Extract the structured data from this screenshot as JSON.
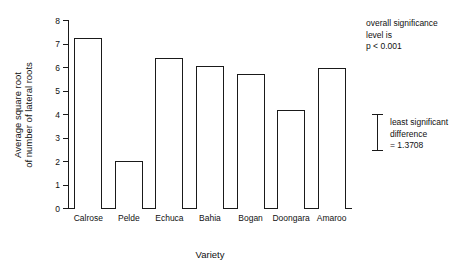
{
  "chart_data": {
    "type": "bar",
    "title": "",
    "subtitle": "",
    "xlabel": "Variety",
    "ylabel": "Average square root\nof number of lateral roots",
    "ylabel_line1": "Average square root",
    "ylabel_line2": "of number of lateral roots",
    "categories": [
      "Calrose",
      "Pelde",
      "Echuca",
      "Bahia",
      "Bogan",
      "Doongara",
      "Amaroo"
    ],
    "values": [
      7.25,
      2.0,
      6.4,
      6.05,
      5.7,
      4.15,
      5.95
    ],
    "ylim": [
      0,
      8
    ],
    "ytick_values": [
      0,
      1,
      2,
      3,
      4,
      5,
      6,
      7,
      8
    ],
    "ytick_labels": [
      "0",
      "1",
      "2",
      "3",
      "4",
      "5",
      "6",
      "7",
      "8"
    ],
    "grid": false,
    "legend": null,
    "bar_fill": "#ffffff",
    "bar_edge": "#1a1a1a",
    "annotations": [
      {
        "name": "overall-significance",
        "lines": [
          "overall significance",
          "level is",
          "p < 0.001"
        ]
      },
      {
        "name": "least-significant-difference",
        "lines": [
          "least significant",
          "difference",
          "= 1.3708"
        ],
        "value": 1.3708,
        "marker": "error-bar"
      }
    ]
  },
  "annotations": {
    "significance": {
      "line1": "overall significance",
      "line2": "level is",
      "line3": "p < 0.001"
    },
    "lsd": {
      "line1": "least significant",
      "line2": "difference",
      "line3": "= 1.3708"
    }
  },
  "axes": {
    "x_title": "Variety",
    "y_title_line1": "Average square root",
    "y_title_line2": "of number of lateral roots"
  }
}
